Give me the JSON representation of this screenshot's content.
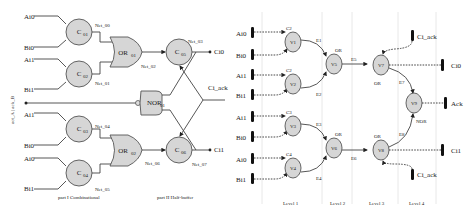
{
  "left_circuit": {
    "side_label": "act_A | ack_B",
    "inputs": [
      "Ai0",
      "Bi0",
      "Ai1",
      "Bi1",
      "Ai1",
      "Bi0",
      "Ai0",
      "Bi1"
    ],
    "c_gates": [
      "C",
      "C",
      "C",
      "C"
    ],
    "c_subs": [
      "01",
      "02",
      "03",
      "04"
    ],
    "or_gates": [
      {
        "name": "OR",
        "sub": "01"
      },
      {
        "name": "OR",
        "sub": "02"
      }
    ],
    "nor_gate": {
      "name": "NOR",
      "sub": "01"
    },
    "out_c": [
      {
        "name": "C",
        "sub": "05"
      },
      {
        "name": "C",
        "sub": "06"
      }
    ],
    "nets": [
      "Net_00",
      "Net_01",
      "Net_02",
      "Net_03",
      "Net_04",
      "Net_05",
      "Net_06",
      "Net_07"
    ],
    "outputs": {
      "top": "Ci0",
      "ack": "Ci_ack",
      "bottom": "Ci1"
    },
    "part_labels": [
      "part I  Combinational",
      "part II  Half-buffer"
    ]
  },
  "right_graph": {
    "inputs": [
      "Ai0",
      "Bi0",
      "Ai1",
      "Bi1",
      "Ai1",
      "Bi0",
      "Ai0",
      "Bi1"
    ],
    "nodes": [
      "V1",
      "V2",
      "V3",
      "V4",
      "V5",
      "V6",
      "V7",
      "V8",
      "V9"
    ],
    "node_tags": {
      "v1": "C2",
      "v1s": "1",
      "v2": "C2",
      "v2s": "2",
      "v3": "C3",
      "v3s": "3",
      "v4": "C4",
      "v4s": "4",
      "v5": "OR",
      "v5s": "01",
      "v6": "OR",
      "v6s": "02",
      "v7": "OR",
      "v7s": "11",
      "v8": "OR",
      "v8s": "12",
      "v9": "NOR",
      "v9s": "01"
    },
    "edges": [
      "E1",
      "E2",
      "E3",
      "E4",
      "E5",
      "E6",
      "E7",
      "E8"
    ],
    "ports": {
      "ack_top": "Ci_ack",
      "out0": "Ci0",
      "ack_out": "Ack",
      "out1": "Ci1",
      "ack_bottom": "Ci_ack"
    },
    "levels": [
      "Level 1",
      "Level 2",
      "Level 3",
      "Level 4"
    ]
  }
}
